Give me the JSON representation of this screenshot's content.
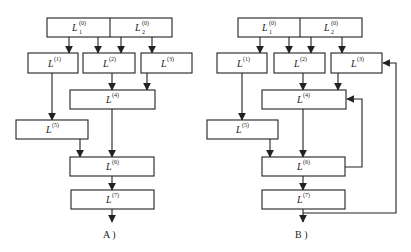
{
  "diagram_a": {
    "caption": "A )",
    "nodes": {
      "L01": {
        "base": "L",
        "sup": "(0)",
        "sub": "1"
      },
      "L02": {
        "base": "L",
        "sup": "(0)",
        "sub": "2"
      },
      "L1": {
        "base": "L",
        "sup": "(1)"
      },
      "L2": {
        "base": "L",
        "sup": "(2)"
      },
      "L3": {
        "base": "L",
        "sup": "(3)"
      },
      "L4": {
        "base": "L",
        "sup": "(4)"
      },
      "L5": {
        "base": "L",
        "sup": "(5)"
      },
      "L6": {
        "base": "L",
        "sup": "(6)"
      },
      "L7": {
        "base": "L",
        "sup": "(7)"
      }
    },
    "edges": [
      [
        "L01",
        "L1"
      ],
      [
        "L01",
        "L2"
      ],
      [
        "L02",
        "L2"
      ],
      [
        "L02",
        "L3"
      ],
      [
        "L2",
        "L4"
      ],
      [
        "L3",
        "L4"
      ],
      [
        "L1",
        "L5"
      ],
      [
        "L5",
        "L6"
      ],
      [
        "L4",
        "L6"
      ],
      [
        "L6",
        "L7"
      ],
      [
        "L7",
        "output"
      ]
    ]
  },
  "diagram_b": {
    "caption": "B )",
    "nodes": {
      "L01": {
        "base": "L",
        "sup": "(0)",
        "sub": "1"
      },
      "L02": {
        "base": "L",
        "sup": "(0)",
        "sub": "2"
      },
      "L1": {
        "base": "L",
        "sup": "(1)"
      },
      "L2": {
        "base": "L",
        "sup": "(2)"
      },
      "L3": {
        "base": "L",
        "sup": "(3)"
      },
      "L4": {
        "base": "L",
        "sup": "(4)"
      },
      "L5": {
        "base": "L",
        "sup": "(5)"
      },
      "L6": {
        "base": "L",
        "sup": "(6)"
      },
      "L7": {
        "base": "L",
        "sup": "(7)"
      }
    },
    "edges": [
      [
        "L01",
        "L1"
      ],
      [
        "L01",
        "L2"
      ],
      [
        "L02",
        "L2"
      ],
      [
        "L02",
        "L3"
      ],
      [
        "L2",
        "L4"
      ],
      [
        "L3",
        "L4"
      ],
      [
        "L1",
        "L5"
      ],
      [
        "L5",
        "L6"
      ],
      [
        "L4",
        "L6"
      ],
      [
        "L6",
        "L7"
      ],
      [
        "L7",
        "output"
      ],
      [
        "L6",
        "L4",
        "feedback"
      ],
      [
        "L7",
        "L3",
        "feedback"
      ]
    ]
  }
}
